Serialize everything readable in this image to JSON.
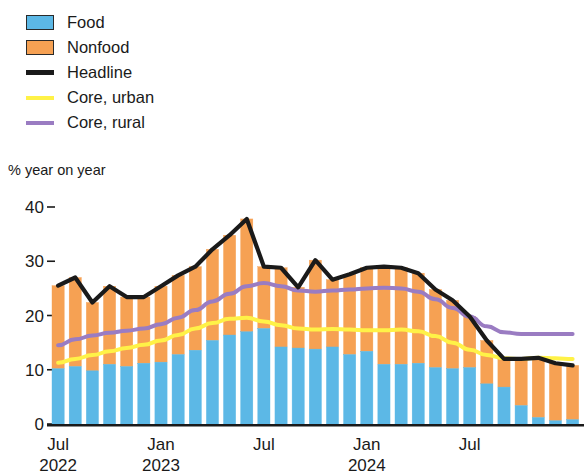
{
  "legend": {
    "items": [
      {
        "label": "Food",
        "marker": "box",
        "color": "#5cb8e6",
        "name": "legend-item-food"
      },
      {
        "label": "Nonfood",
        "marker": "box",
        "color": "#f6a153",
        "name": "legend-item-nonfood"
      },
      {
        "label": "Headline",
        "marker": "line",
        "color": "#1a1a1a",
        "name": "legend-item-headline"
      },
      {
        "label": "Core, urban",
        "marker": "line",
        "color": "#fff247",
        "name": "legend-item-core-urban"
      },
      {
        "label": "Core, rural",
        "marker": "line",
        "color": "#9a7cc2",
        "name": "legend-item-core-rural"
      }
    ]
  },
  "axis": {
    "unit_caption": "% year on year",
    "y_ticks": [
      "40",
      "30",
      "20",
      "10",
      "0"
    ],
    "y_values": [
      40,
      30,
      20,
      10,
      0
    ],
    "x_tick_labels": [
      {
        "month": "Jul",
        "year": "2022",
        "index": 0
      },
      {
        "month": "Jan",
        "year": "2023",
        "index": 6
      },
      {
        "month": "Jul",
        "year": "",
        "index": 12
      },
      {
        "month": "Jan",
        "year": "2024",
        "index": 18
      },
      {
        "month": "Jul",
        "year": "",
        "index": 24
      }
    ]
  },
  "chart_data": {
    "type": "bar",
    "title": "",
    "subtitle": "",
    "xlabel": "",
    "ylabel": "% year on year",
    "ylim": [
      0,
      40
    ],
    "grid": false,
    "legend_position": "top-left",
    "categories": [
      "Jul 2022",
      "Aug 2022",
      "Sep 2022",
      "Oct 2022",
      "Nov 2022",
      "Dec 2022",
      "Jan 2023",
      "Feb 2023",
      "Mar 2023",
      "Apr 2023",
      "May 2023",
      "Jun 2023",
      "Jul 2023",
      "Aug 2023",
      "Sep 2023",
      "Oct 2023",
      "Nov 2023",
      "Dec 2023",
      "Jan 2024",
      "Feb 2024",
      "Mar 2024",
      "Apr 2024",
      "May 2024",
      "Jun 2024",
      "Jul 2024",
      "Aug 2024",
      "Sep 2024",
      "Oct 2024",
      "Nov 2024",
      "Dec 2024",
      "Jan 2025"
    ],
    "series": [
      {
        "name": "Food",
        "type": "bar-stacked",
        "color": "#5cb8e6",
        "values": [
          10.2,
          10.6,
          9.8,
          11.0,
          10.6,
          11.2,
          11.4,
          12.8,
          13.6,
          15.4,
          16.4,
          17.0,
          17.6,
          14.2,
          14.0,
          13.8,
          14.2,
          12.8,
          13.4,
          11.0,
          11.0,
          11.2,
          10.4,
          10.2,
          10.4,
          7.4,
          6.8,
          3.4,
          1.2,
          0.6,
          0.8
        ]
      },
      {
        "name": "Nonfood",
        "type": "bar-stacked",
        "color": "#f6a153",
        "values": [
          15.3,
          16.4,
          12.6,
          14.4,
          12.8,
          12.2,
          14.0,
          14.6,
          15.4,
          16.8,
          18.4,
          20.8,
          11.4,
          14.6,
          11.2,
          16.4,
          12.4,
          14.8,
          15.4,
          18.0,
          17.8,
          16.6,
          14.4,
          12.6,
          9.4,
          8.0,
          5.2,
          8.6,
          11.0,
          10.6,
          10.0
        ]
      },
      {
        "name": "Headline",
        "type": "line",
        "color": "#1a1a1a",
        "values": [
          25.5,
          27.0,
          22.4,
          25.4,
          23.4,
          23.4,
          25.4,
          27.4,
          29.0,
          32.2,
          34.8,
          37.8,
          29.0,
          28.8,
          25.2,
          30.2,
          26.6,
          27.6,
          28.8,
          29.0,
          28.8,
          27.8,
          24.8,
          22.8,
          19.8,
          15.4,
          12.0,
          12.0,
          12.2,
          11.2,
          10.8
        ]
      },
      {
        "name": "Core, urban",
        "type": "line",
        "color": "#fff247",
        "values": [
          11.3,
          12.0,
          12.7,
          13.4,
          14.0,
          14.6,
          15.4,
          16.4,
          17.6,
          18.6,
          19.4,
          19.6,
          18.9,
          18.2,
          17.6,
          17.4,
          17.5,
          17.4,
          17.3,
          17.3,
          17.4,
          17.1,
          16.2,
          15.0,
          13.7,
          12.7,
          12.1,
          12.0,
          12.2,
          12.1,
          12.0
        ]
      },
      {
        "name": "Core, rural",
        "type": "line",
        "color": "#9a7cc2",
        "values": [
          14.5,
          15.6,
          16.3,
          16.8,
          17.2,
          17.6,
          18.4,
          19.6,
          21.0,
          22.6,
          24.0,
          25.4,
          26.0,
          25.4,
          24.6,
          24.4,
          24.6,
          24.8,
          25.0,
          25.1,
          25.0,
          24.4,
          23.0,
          21.4,
          19.8,
          18.0,
          16.9,
          16.6,
          16.6,
          16.6,
          16.6
        ]
      }
    ]
  }
}
